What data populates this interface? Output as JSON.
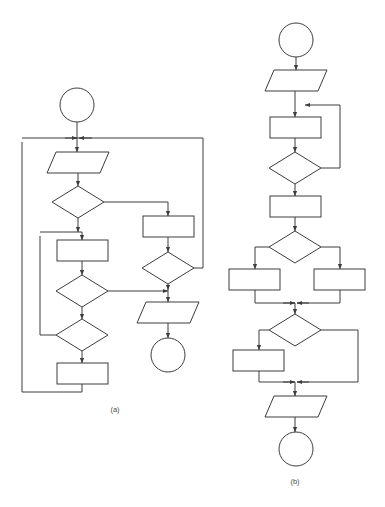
{
  "figure": {
    "background_color": "#ffffff",
    "stroke_color": "#3d3d3d",
    "fill_color": "#ffffff",
    "width": 385,
    "height": 507,
    "caption_a": "(a)",
    "caption_b": "(b)"
  },
  "diagram_a": {
    "label": "(a)",
    "label_x": 115,
    "label_y": 412,
    "nodes": [
      {
        "name": "start-terminal-a",
        "type": "terminator-circle",
        "cx": 77,
        "cy": 105,
        "r": 17,
        "text": ""
      },
      {
        "name": "input-parallelogram-a",
        "type": "io-parallelogram",
        "x": 47,
        "y": 152,
        "w": 62,
        "h": 21,
        "skew": 9,
        "text": ""
      },
      {
        "name": "decision-1-a",
        "type": "decision-diamond",
        "cx": 78,
        "cy": 202,
        "rx": 26,
        "ry": 16,
        "text": ""
      },
      {
        "name": "process-right-a",
        "type": "process-rect",
        "x": 143,
        "y": 216,
        "w": 51,
        "h": 21,
        "text": ""
      },
      {
        "name": "decision-right-a",
        "type": "decision-diamond",
        "cx": 168,
        "cy": 268,
        "rx": 26,
        "ry": 16,
        "text": ""
      },
      {
        "name": "process-1-a",
        "type": "process-rect",
        "x": 57,
        "y": 240,
        "w": 51,
        "h": 21,
        "text": ""
      },
      {
        "name": "decision-2-a",
        "type": "decision-diamond",
        "cx": 82,
        "cy": 291,
        "rx": 26,
        "ry": 16,
        "text": ""
      },
      {
        "name": "decision-3-a",
        "type": "decision-diamond",
        "cx": 82,
        "cy": 335,
        "rx": 26,
        "ry": 16,
        "text": ""
      },
      {
        "name": "process-2-a",
        "type": "process-rect",
        "x": 57,
        "y": 363,
        "w": 51,
        "h": 21,
        "text": ""
      },
      {
        "name": "output-parallelogram-a",
        "type": "io-parallelogram",
        "x": 137,
        "y": 302,
        "w": 62,
        "h": 21,
        "skew": 9,
        "text": ""
      },
      {
        "name": "end-terminal-a",
        "type": "terminator-circle",
        "cx": 168,
        "cy": 355,
        "r": 17,
        "text": ""
      }
    ],
    "connectors": [
      {
        "name": "conn-start-to-merge",
        "points": "77,122 77,138"
      },
      {
        "name": "conn-merge-to-input",
        "points": "77,138 77,152",
        "arrow": true
      },
      {
        "name": "conn-outer-right-loop",
        "points": "203,138 22,138"
      },
      {
        "name": "conn-merge-left-arrow",
        "points": "65,138 77,138",
        "arrow": true
      },
      {
        "name": "conn-merge-right-arrow",
        "points": "92,138 79,138",
        "arrow": true
      },
      {
        "name": "conn-input-to-decision1",
        "points": "78,173 78,186",
        "arrow": true
      },
      {
        "name": "conn-decision1-right",
        "points": "104,202 168,202 168,216",
        "arrow": true
      },
      {
        "name": "conn-decision1-down",
        "points": "78,218 78,232",
        "arrow": true
      },
      {
        "name": "conn-process-right-to-decision",
        "points": "168,237 168,252",
        "arrow": true
      },
      {
        "name": "conn-decision-right-to-outerline",
        "points": "194,268 203,268 203,138"
      },
      {
        "name": "conn-decision-right-down",
        "points": "168,284 168,290",
        "arrow": true
      },
      {
        "name": "conn-merge-to-output",
        "points": "168,290 168,302",
        "arrow": true
      },
      {
        "name": "conn-output-to-end",
        "points": "168,323 168,338",
        "arrow": true
      },
      {
        "name": "conn-inner-loop-into-process1",
        "points": "40,232 82,232 82,240",
        "arrow": true
      },
      {
        "name": "conn-process1-to-decision2",
        "points": "82,261 82,275",
        "arrow": true
      },
      {
        "name": "conn-decision2-right-to-merge",
        "points": "108,291 168,291",
        "arrow": true
      },
      {
        "name": "conn-decision2-down",
        "points": "82,307 82,319",
        "arrow": true
      },
      {
        "name": "conn-decision3-left",
        "points": "56,335 40,335 40,236"
      },
      {
        "name": "conn-decision3-down",
        "points": "82,351 82,363",
        "arrow": true
      },
      {
        "name": "conn-process2-to-outer-left",
        "points": "82,384 82,392 22,392 22,142"
      }
    ]
  },
  "diagram_b": {
    "label": "(b)",
    "label_x": 295,
    "label_y": 484,
    "nodes": [
      {
        "name": "start-terminal-b",
        "type": "terminator-circle",
        "cx": 296,
        "cy": 40,
        "r": 17,
        "text": ""
      },
      {
        "name": "input-parallelogram-b",
        "type": "io-parallelogram",
        "x": 265,
        "y": 70,
        "w": 62,
        "h": 21,
        "skew": 9,
        "text": ""
      },
      {
        "name": "process-loop-b",
        "type": "process-rect",
        "x": 270,
        "y": 117,
        "w": 51,
        "h": 21,
        "text": ""
      },
      {
        "name": "decision-loop-b",
        "type": "decision-diamond",
        "cx": 295,
        "cy": 168,
        "rx": 26,
        "ry": 16,
        "text": ""
      },
      {
        "name": "process-after-loop-b",
        "type": "process-rect",
        "x": 270,
        "y": 196,
        "w": 51,
        "h": 21,
        "text": ""
      },
      {
        "name": "decision-branch-b",
        "type": "decision-diamond",
        "cx": 295,
        "cy": 247,
        "rx": 26,
        "ry": 16,
        "text": ""
      },
      {
        "name": "process-left-branch-b",
        "type": "process-rect",
        "x": 229,
        "y": 269,
        "w": 51,
        "h": 21,
        "text": ""
      },
      {
        "name": "process-right-branch-b",
        "type": "process-rect",
        "x": 314,
        "y": 269,
        "w": 51,
        "h": 21,
        "text": ""
      },
      {
        "name": "decision-if-b",
        "type": "decision-diamond",
        "cx": 295,
        "cy": 330,
        "rx": 26,
        "ry": 16,
        "text": ""
      },
      {
        "name": "process-if-body-b",
        "type": "process-rect",
        "x": 233,
        "y": 350,
        "w": 51,
        "h": 21,
        "text": ""
      },
      {
        "name": "output-parallelogram-b",
        "type": "io-parallelogram",
        "x": 265,
        "y": 396,
        "w": 62,
        "h": 21,
        "skew": 9,
        "text": ""
      },
      {
        "name": "end-terminal-b",
        "type": "terminator-circle",
        "cx": 296,
        "cy": 449,
        "r": 17,
        "text": ""
      }
    ],
    "connectors": [
      {
        "name": "conn-b-start-to-input",
        "points": "296,57 296,70",
        "arrow": true
      },
      {
        "name": "conn-b-input-to-merge",
        "points": "295,91 295,105"
      },
      {
        "name": "conn-b-merge-to-process",
        "points": "295,105 295,117",
        "arrow": true
      },
      {
        "name": "conn-b-loopback",
        "points": "321,168 340,168 340,105 305,105",
        "arrow": true
      },
      {
        "name": "conn-b-process-to-decision",
        "points": "295,138 295,152",
        "arrow": true
      },
      {
        "name": "conn-b-decision-down",
        "points": "295,184 295,196",
        "arrow": true
      },
      {
        "name": "conn-b-process-to-branch",
        "points": "295,217 295,231",
        "arrow": true
      },
      {
        "name": "conn-b-branch-left",
        "points": "269,247 255,247 255,269",
        "arrow": true
      },
      {
        "name": "conn-b-branch-right",
        "points": "321,247 340,247 340,269",
        "arrow": true
      },
      {
        "name": "conn-b-left-merge",
        "points": "255,290 255,303 295,303"
      },
      {
        "name": "conn-b-right-merge",
        "points": "340,290 340,303 297,303"
      },
      {
        "name": "conn-b-merge-left-arrow",
        "points": "283,303 295,303",
        "arrow": true
      },
      {
        "name": "conn-b-merge-right-arrow",
        "points": "309,303 297,303",
        "arrow": true
      },
      {
        "name": "conn-b-merge-to-if",
        "points": "295,303 295,314",
        "arrow": true
      },
      {
        "name": "conn-b-if-left",
        "points": "269,330 259,330 259,350",
        "arrow": true
      },
      {
        "name": "conn-b-if-right-bypass",
        "points": "321,330 358,330 358,382 297,382"
      },
      {
        "name": "conn-b-if-body-merge",
        "points": "259,371 259,382 295,382"
      },
      {
        "name": "conn-b-final-merge-left",
        "points": "283,382 295,382",
        "arrow": true
      },
      {
        "name": "conn-b-final-merge-right",
        "points": "309,382 297,382",
        "arrow": true
      },
      {
        "name": "conn-b-merge-to-output",
        "points": "295,382 295,396",
        "arrow": true
      },
      {
        "name": "conn-b-output-to-end",
        "points": "295,417 295,432",
        "arrow": true
      }
    ]
  }
}
